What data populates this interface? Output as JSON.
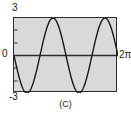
{
  "figure": {
    "caption": "(C)",
    "plot_bg_color": "#d9d9d9",
    "frame_color": "#2e2e2e",
    "curve_color": "#1a1a1a",
    "page_bg_color": "#ffffff"
  },
  "labels": {
    "y_max": "3",
    "y_zero": "0",
    "y_min": "-3",
    "x_max": "2π"
  },
  "chart_data": {
    "type": "line",
    "title": "",
    "subtitle": "",
    "xlabel": "",
    "ylabel": "",
    "xlim": [
      0,
      6.283185307179586
    ],
    "ylim": [
      -3,
      3
    ],
    "xticks": [
      0,
      6.283185307179586
    ],
    "xticklabels": [
      "0",
      "2π"
    ],
    "yticks": [
      -3,
      0,
      3
    ],
    "yticklabels": [
      "-3",
      "0",
      "3"
    ],
    "grid": false,
    "legend": null,
    "annotations": [
      "(C)"
    ],
    "series": [
      {
        "name": "y = -3 sin(2x)",
        "expression": "-3*sin(2*x)",
        "amplitude": 3,
        "period": 3.141592653589793,
        "cycles": 2,
        "phase": "starts at 0 descending",
        "color": "#1a1a1a",
        "x": [
          0.0,
          0.1963,
          0.3927,
          0.589,
          0.7854,
          0.9817,
          1.1781,
          1.3744,
          1.5708,
          1.7671,
          1.9635,
          2.1598,
          2.3562,
          2.5525,
          2.7489,
          2.9452,
          3.1416,
          3.3379,
          3.5343,
          3.7306,
          3.927,
          4.1233,
          4.3197,
          4.516,
          4.7124,
          4.9087,
          5.1051,
          5.3014,
          5.4978,
          5.6941,
          5.8905,
          6.0868,
          6.2832
        ],
        "y": [
          0.0,
          -1.1481,
          -2.1213,
          -2.7716,
          -3.0,
          -2.7716,
          -2.1213,
          -1.1481,
          0.0,
          1.1481,
          2.1213,
          2.7716,
          3.0,
          2.7716,
          2.1213,
          1.1481,
          0.0,
          -1.1481,
          -2.1213,
          -2.7716,
          -3.0,
          -2.7716,
          -2.1213,
          -1.1481,
          0.0,
          1.1481,
          2.1213,
          2.7716,
          3.0,
          2.7716,
          2.1213,
          1.1481,
          0.0
        ]
      }
    ]
  }
}
